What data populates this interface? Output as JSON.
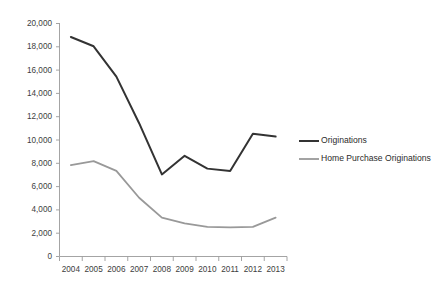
{
  "chart_data": {
    "type": "line",
    "title": "",
    "subtitle": "",
    "xlabel": "",
    "ylabel": "",
    "categories": [
      "2004",
      "2005",
      "2006",
      "2007",
      "2008",
      "2009",
      "2010",
      "2011",
      "2012",
      "2013"
    ],
    "series": [
      {
        "name": "Originations",
        "color": "#333333",
        "values": [
          18800,
          18000,
          15400,
          11400,
          7000,
          8600,
          7500,
          7300,
          10500,
          10250
        ]
      },
      {
        "name": "Home Purchase Originations",
        "color": "#999999",
        "values": [
          7800,
          8150,
          7300,
          5000,
          3300,
          2800,
          2500,
          2450,
          2500,
          3300
        ]
      }
    ],
    "ylim": [
      0,
      20000
    ],
    "y_ticks": [
      0,
      2000,
      4000,
      6000,
      8000,
      10000,
      12000,
      14000,
      16000,
      18000,
      20000
    ],
    "y_tick_labels": [
      "0",
      "2,000",
      "4,000",
      "6,000",
      "8,000",
      "10,000",
      "12,000",
      "14,000",
      "16,000",
      "18,000",
      "20,000"
    ],
    "grid": false,
    "legend_position": "right"
  },
  "legend": {
    "entries": [
      {
        "label": "Originations",
        "color": "#333333"
      },
      {
        "label": "Home Purchase Originations",
        "color": "#999999"
      }
    ]
  },
  "axes": {
    "y_axis_name": "value-axis",
    "x_axis_name": "year-axis"
  }
}
